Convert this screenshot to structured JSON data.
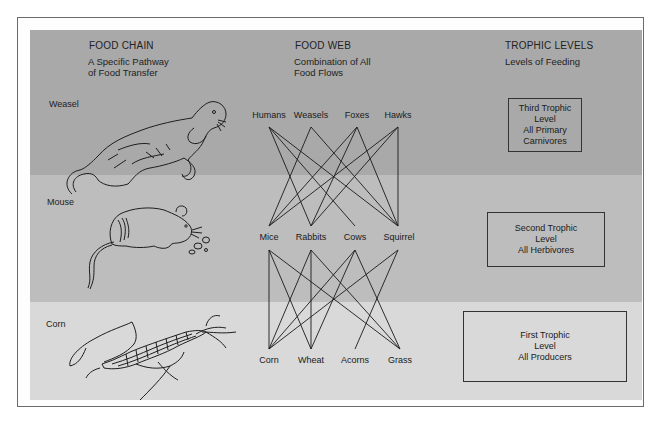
{
  "columns": {
    "food_chain": {
      "title": "FOOD CHAIN",
      "subtitle_lines": [
        "A Specific Pathway",
        "of Food Transfer"
      ]
    },
    "food_web": {
      "title": "FOOD WEB",
      "subtitle_lines": [
        "Combination of All",
        "Food Flows"
      ]
    },
    "trophic_levels": {
      "title": "TROPHIC LEVELS",
      "subtitle_lines": [
        "Levels of Feeding"
      ]
    }
  },
  "food_chain": [
    {
      "label": "Weasel",
      "icon": "weasel-illustration"
    },
    {
      "label": "Mouse",
      "icon": "mouse-illustration"
    },
    {
      "label": "Corn",
      "icon": "corn-illustration"
    }
  ],
  "food_web": {
    "top_row": [
      "Humans",
      "Weasels",
      "Foxes",
      "Hawks"
    ],
    "middle_row": [
      "Mice",
      "Rabbits",
      "Cows",
      "Squirrel"
    ],
    "bottom_row": [
      "Corn",
      "Wheat",
      "Acorns",
      "Grass"
    ],
    "edges_top_to_middle": [
      [
        "Humans",
        "Rabbits"
      ],
      [
        "Humans",
        "Cows"
      ],
      [
        "Humans",
        "Squirrel"
      ],
      [
        "Weasels",
        "Mice"
      ],
      [
        "Weasels",
        "Squirrel"
      ],
      [
        "Foxes",
        "Mice"
      ],
      [
        "Foxes",
        "Rabbits"
      ],
      [
        "Foxes",
        "Squirrel"
      ],
      [
        "Hawks",
        "Mice"
      ],
      [
        "Hawks",
        "Rabbits"
      ],
      [
        "Hawks",
        "Squirrel"
      ]
    ],
    "edges_middle_to_bottom": [
      [
        "Mice",
        "Corn"
      ],
      [
        "Mice",
        "Wheat"
      ],
      [
        "Mice",
        "Grass"
      ],
      [
        "Rabbits",
        "Corn"
      ],
      [
        "Rabbits",
        "Wheat"
      ],
      [
        "Rabbits",
        "Grass"
      ],
      [
        "Cows",
        "Corn"
      ],
      [
        "Cows",
        "Wheat"
      ],
      [
        "Cows",
        "Grass"
      ],
      [
        "Squirrel",
        "Corn"
      ],
      [
        "Squirrel",
        "Acorns"
      ]
    ]
  },
  "trophic_levels": [
    {
      "lines": [
        "Third Trophic",
        "Level",
        "All Primary",
        "Carnivores"
      ]
    },
    {
      "lines": [
        "Second Trophic",
        "Level",
        "All Herbivores"
      ]
    },
    {
      "lines": [
        "First Trophic",
        "Level",
        "All Producers"
      ]
    }
  ],
  "colors": {
    "band_top": "#a9a9a9",
    "band_middle": "#bdbdbd",
    "band_bottom": "#d9d9d9",
    "line": "#1a1a1a"
  }
}
